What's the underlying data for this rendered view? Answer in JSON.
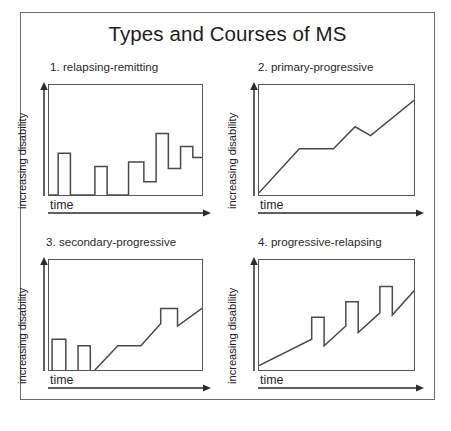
{
  "figure": {
    "title": "Types and Courses of MS",
    "background_color": "#ffffff",
    "frame_color": "#6b6b6b",
    "line_color": "#555555"
  },
  "axis_labels": {
    "y": "increasing disability",
    "x": "time"
  },
  "chart_data": [
    {
      "type": "line",
      "title": "1. relapsing-remitting",
      "xlabel": "time",
      "ylabel": "increasing disability",
      "xlim": [
        0,
        100
      ],
      "ylim": [
        0,
        100
      ],
      "grid": false,
      "legend": "none",
      "annotation": "step-wise relapses with partial remission; baseline disability stays near zero early then accumulates",
      "x": [
        0,
        6,
        6,
        14,
        14,
        30,
        30,
        38,
        38,
        52,
        52,
        62,
        62,
        70,
        70,
        78,
        78,
        86,
        86,
        94,
        94,
        100
      ],
      "y": [
        0,
        0,
        38,
        38,
        0,
        0,
        26,
        26,
        0,
        0,
        30,
        30,
        12,
        12,
        56,
        56,
        24,
        24,
        44,
        44,
        34,
        34
      ]
    },
    {
      "type": "line",
      "title": "2. primary-progressive",
      "xlabel": "time",
      "ylabel": "increasing disability",
      "xlim": [
        0,
        100
      ],
      "ylim": [
        0,
        100
      ],
      "grid": false,
      "legend": "none",
      "annotation": "steady accumulation of disability from onset with occasional plateaus and minor dips",
      "x": [
        0,
        26,
        48,
        62,
        72,
        100
      ],
      "y": [
        2,
        42,
        42,
        62,
        54,
        86
      ]
    },
    {
      "type": "line",
      "title": "3. secondary-progressive",
      "xlabel": "time",
      "ylabel": "increasing disability",
      "xlim": [
        0,
        100
      ],
      "ylim": [
        0,
        100
      ],
      "grid": false,
      "legend": "none",
      "annotation": "initial relapsing phase with two discrete attacks, then steady progression with one later relapse",
      "x": [
        0,
        7,
        7,
        16,
        16,
        26,
        26,
        34,
        34,
        30,
        30,
        44,
        44,
        60,
        60,
        74,
        74,
        84,
        84,
        100
      ],
      "y": [
        0,
        0,
        28,
        28,
        0,
        0,
        22,
        22,
        0,
        0,
        0,
        22,
        22,
        34,
        34,
        52,
        52,
        40,
        40,
        56
      ]
    },
    {
      "type": "line",
      "title": "4. progressive-relapsing",
      "xlabel": "time",
      "ylabel": "increasing disability",
      "xlim": [
        0,
        100
      ],
      "ylim": [
        0,
        100
      ],
      "grid": false,
      "legend": "none",
      "annotation": "steady progression from onset punctuated by three superimposed relapse spikes of increasing height",
      "x": [
        0,
        34,
        34,
        42,
        42,
        56,
        56,
        64,
        64,
        78,
        78,
        86,
        86,
        100
      ],
      "y": [
        4,
        28,
        48,
        48,
        22,
        40,
        62,
        62,
        34,
        52,
        76,
        76,
        50,
        72
      ]
    }
  ]
}
